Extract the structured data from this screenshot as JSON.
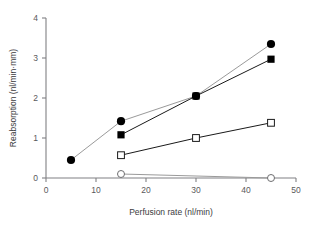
{
  "chart_data": {
    "type": "line",
    "title": "",
    "subtitle": "",
    "xlabel": "Perfusion rate (nl/min)",
    "ylabel": "Reabsorption (nl/min·mm)",
    "xlim": [
      0,
      50
    ],
    "ylim": [
      0,
      4
    ],
    "xticks": [
      0,
      10,
      20,
      30,
      40,
      50
    ],
    "yticks": [
      0,
      1,
      2,
      3,
      4
    ],
    "xtick_labels": [
      "0",
      "10",
      "20",
      "30",
      "40",
      "50"
    ],
    "ytick_labels": [
      "0",
      "1",
      "2",
      "3",
      "4"
    ],
    "grid": false,
    "legend": "none",
    "series": [
      {
        "name": "filled-circle-series",
        "marker": "filled-circle",
        "marker_color": "#000000",
        "line_color": "#9a9a9a",
        "x": [
          5,
          15,
          30,
          45
        ],
        "y": [
          0.45,
          1.42,
          2.05,
          3.35
        ]
      },
      {
        "name": "filled-square-series",
        "marker": "filled-square",
        "marker_color": "#000000",
        "line_color": "#1a1a1a",
        "x": [
          15,
          30,
          45
        ],
        "y": [
          1.08,
          2.05,
          2.97
        ]
      },
      {
        "name": "open-square-series",
        "marker": "open-square",
        "marker_color": "#ffffff",
        "line_color": "#1a1a1a",
        "x": [
          15,
          30,
          45
        ],
        "y": [
          0.57,
          1.0,
          1.38
        ]
      },
      {
        "name": "open-circle-series",
        "marker": "open-circle",
        "marker_color": "#ffffff",
        "line_color": "#9a9a9a",
        "x": [
          15,
          45
        ],
        "y": [
          0.1,
          0.0
        ]
      }
    ]
  },
  "axis_style": {
    "axis_color": "#808083",
    "tick_label_color": "#59595b",
    "title_color": "#3b3b3d"
  }
}
